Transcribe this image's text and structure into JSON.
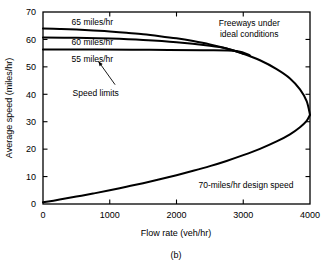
{
  "figure": {
    "caption": "(b)",
    "background": "#ffffff",
    "ink_color": "#000000"
  },
  "chart_data": {
    "type": "line",
    "title": "",
    "xlabel": "Flow rate (veh/hr)",
    "ylabel": "Average speed (miles/hr)",
    "xlim": [
      0,
      4000
    ],
    "ylim": [
      0,
      70
    ],
    "xticks": [
      0,
      1000,
      2000,
      3000,
      4000
    ],
    "xtick_labels": [
      "0",
      "1000",
      "2000",
      "3000",
      "4000"
    ],
    "yticks": [
      0,
      10,
      20,
      30,
      40,
      50,
      60,
      70
    ],
    "ytick_labels": [
      "0",
      "10",
      "20",
      "30",
      "40",
      "50",
      "60",
      "70"
    ],
    "grid": false,
    "legend": "none",
    "tick_direction": "in",
    "frame": "box",
    "series": [
      {
        "name": "65 miles/hr speed limit",
        "label": "65 miles/hr",
        "points": [
          [
            0,
            64.0
          ],
          [
            250,
            63.8
          ],
          [
            500,
            63.6
          ],
          [
            750,
            63.3
          ],
          [
            1000,
            62.9
          ],
          [
            1250,
            62.4
          ],
          [
            1500,
            61.9
          ],
          [
            1750,
            61.2
          ],
          [
            2000,
            60.4
          ],
          [
            2250,
            59.4
          ],
          [
            2500,
            58.2
          ],
          [
            2750,
            56.7
          ],
          [
            3000,
            54.8
          ],
          [
            3250,
            52.4
          ],
          [
            3500,
            49.2
          ],
          [
            3700,
            45.8
          ],
          [
            3850,
            41.8
          ],
          [
            3950,
            37.5
          ],
          [
            4000,
            32.5
          ]
        ]
      },
      {
        "name": "60 miles/hr speed limit",
        "label": "60 miles/hr",
        "points": [
          [
            0,
            60.7
          ],
          [
            500,
            60.6
          ],
          [
            1000,
            60.3
          ],
          [
            1500,
            59.8
          ],
          [
            2000,
            59.0
          ],
          [
            2500,
            57.7
          ],
          [
            2750,
            56.7
          ],
          [
            3000,
            54.8
          ]
        ]
      },
      {
        "name": "55 miles/hr speed limit",
        "label": "55 miles/hr",
        "points": [
          [
            0,
            56.3
          ],
          [
            800,
            56.3
          ],
          [
            1600,
            56.2
          ],
          [
            2400,
            56.1
          ],
          [
            2900,
            55.8
          ],
          [
            3100,
            54.2
          ]
        ]
      },
      {
        "name": "70-miles/hr design speed lower branch",
        "label": "70-miles/hr design speed",
        "points": [
          [
            0,
            0.6
          ],
          [
            250,
            1.6
          ],
          [
            500,
            2.7
          ],
          [
            750,
            3.8
          ],
          [
            1000,
            5.0
          ],
          [
            1250,
            6.3
          ],
          [
            1500,
            7.6
          ],
          [
            1750,
            9.0
          ],
          [
            2000,
            10.5
          ],
          [
            2250,
            12.1
          ],
          [
            2500,
            13.8
          ],
          [
            2750,
            15.7
          ],
          [
            3000,
            17.8
          ],
          [
            3250,
            20.1
          ],
          [
            3500,
            22.8
          ],
          [
            3700,
            25.4
          ],
          [
            3850,
            28.0
          ],
          [
            3950,
            30.3
          ],
          [
            4000,
            32.5
          ]
        ]
      }
    ],
    "annotations": [
      {
        "name": "label-65",
        "text": "65 miles/hr",
        "x": 740,
        "y": 66.5
      },
      {
        "name": "label-60",
        "text": "60 miles/hr",
        "x": 740,
        "y": 59.3
      },
      {
        "name": "label-55",
        "text": "55 miles/hr",
        "x": 740,
        "y": 52.8
      },
      {
        "name": "label-speed-limits",
        "text": "Speed limits",
        "x": 790,
        "y": 40.5
      },
      {
        "name": "label-freeways-line1",
        "text": "Freeways under",
        "x": 3090,
        "y": 66.0
      },
      {
        "name": "label-freeways-line2",
        "text": "ideal conditions",
        "x": 3090,
        "y": 62.0
      },
      {
        "name": "label-design-speed",
        "text": "70-miles/hr design speed",
        "x": 3040,
        "y": 7.0
      }
    ],
    "arrow": {
      "name": "speed-limits-arrow",
      "from_x": 1080,
      "from_y": 43.5,
      "to_x": 830,
      "to_y": 52.0
    }
  }
}
